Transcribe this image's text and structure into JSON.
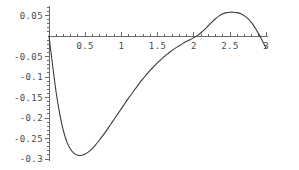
{
  "chart_data": {
    "type": "line",
    "title": "",
    "subtitle": "",
    "xlabel": "",
    "ylabel": "",
    "xlim": [
      0,
      3.03
    ],
    "ylim": [
      -0.305,
      0.072
    ],
    "grid": false,
    "legend": null,
    "axis_style": "mathematica-crossed-axes",
    "x_axis_position_y": 0,
    "y_axis_position_x": 0,
    "xticks": [
      0.5,
      1,
      1.5,
      2,
      2.5,
      3
    ],
    "xtick_labels": [
      "0.5",
      "1",
      "1.5",
      "2",
      "2.5",
      "3"
    ],
    "xticks_minor_step": 0.1,
    "yticks": [
      0.05,
      -0.05,
      -0.1,
      -0.15,
      -0.2,
      -0.25,
      -0.3
    ],
    "ytick_labels": [
      "0.05",
      "-0.05",
      "-0.1",
      "-0.15",
      "-0.2",
      "-0.25",
      "-0.3"
    ],
    "yticks_minor_step": 0.01,
    "series": [
      {
        "name": "curve",
        "color": "#3a3a3a",
        "linewidth": 1.1,
        "x": [
          0.0,
          0.05,
          0.1,
          0.15,
          0.2,
          0.25,
          0.3,
          0.35,
          0.4,
          0.45,
          0.5,
          0.55,
          0.6,
          0.65,
          0.7,
          0.75,
          0.8,
          0.85,
          0.9,
          0.95,
          1.0,
          1.05,
          1.1,
          1.15,
          1.2,
          1.25,
          1.3,
          1.35,
          1.4,
          1.45,
          1.5,
          1.55,
          1.6,
          1.65,
          1.7,
          1.75,
          1.8,
          1.85,
          1.9,
          1.95,
          2.0,
          2.05,
          2.1,
          2.15,
          2.2,
          2.25,
          2.3,
          2.35,
          2.4,
          2.45,
          2.5,
          2.55,
          2.6,
          2.65,
          2.7,
          2.75,
          2.8,
          2.85,
          2.9,
          2.95,
          3.0
        ],
        "y": [
          0.0,
          -0.072,
          -0.139,
          -0.192,
          -0.232,
          -0.26,
          -0.277,
          -0.287,
          -0.291,
          -0.291,
          -0.288,
          -0.282,
          -0.274,
          -0.264,
          -0.253,
          -0.241,
          -0.229,
          -0.216,
          -0.203,
          -0.19,
          -0.177,
          -0.164,
          -0.151,
          -0.139,
          -0.127,
          -0.115,
          -0.104,
          -0.093,
          -0.083,
          -0.074,
          -0.065,
          -0.057,
          -0.049,
          -0.042,
          -0.035,
          -0.029,
          -0.024,
          -0.018,
          -0.013,
          -0.009,
          -0.004,
          0.001,
          0.008,
          0.016,
          0.025,
          0.034,
          0.042,
          0.049,
          0.054,
          0.057,
          0.058,
          0.058,
          0.057,
          0.054,
          0.049,
          0.042,
          0.032,
          0.019,
          0.004,
          -0.013,
          -0.03
        ]
      }
    ],
    "annotations": {
      "minimum_x": 0.45,
      "minimum_y": -0.291,
      "maximum_x": 2.55,
      "maximum_y": 0.058,
      "zero_crossing_x": 2.04,
      "start_point": [
        0,
        0
      ],
      "end_point": [
        3,
        -0.03
      ]
    }
  }
}
